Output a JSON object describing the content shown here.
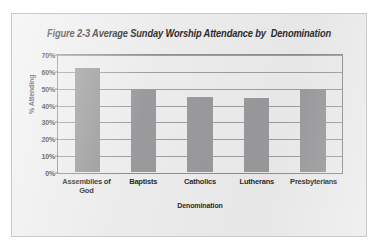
{
  "figure": {
    "title": "Figure 2-3 Average Sunday Worship Attendance by  Denomination"
  },
  "chart_data": {
    "type": "bar",
    "title": "Figure 2-3 Average Sunday Worship Attendance by  Denomination",
    "xlabel": "Denomination",
    "ylabel": "% Attending",
    "categories": [
      "Assemblies of God",
      "Baptists",
      "Catholics",
      "Lutherans",
      "Presbyterians"
    ],
    "category_lines": [
      [
        "Assemblies of",
        "God"
      ],
      [
        "Baptists"
      ],
      [
        "Catholics"
      ],
      [
        "Lutherans"
      ],
      [
        "Presbyterians"
      ]
    ],
    "values": [
      63,
      50,
      45,
      44.5,
      50
    ],
    "ylim": [
      0,
      70
    ],
    "ytick_values": [
      0,
      10,
      20,
      30,
      40,
      50,
      60,
      70
    ],
    "ytick_labels": [
      "0%",
      "10%",
      "20%",
      "30%",
      "40%",
      "50%",
      "60%",
      "70%"
    ],
    "grid": true,
    "legend": false,
    "colors": {
      "bar": "#9a9a9c",
      "plot_background": "#ececed",
      "page_background": "#ececed",
      "gridline": "#9d9d9f",
      "axis_border": "#8e8e90",
      "text": "#2b2b2b"
    }
  }
}
